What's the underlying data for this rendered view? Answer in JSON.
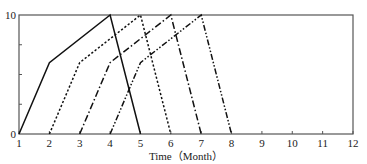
{
  "chart_data": {
    "type": "line",
    "title": "",
    "xlabel": "Time（Month）",
    "ylabel": "",
    "xlim": [
      1,
      12
    ],
    "ylim": [
      0,
      10
    ],
    "x_ticks": [
      1,
      2,
      3,
      4,
      5,
      6,
      7,
      8,
      9,
      10,
      11,
      12
    ],
    "y_tick_labels": [
      {
        "value": 0,
        "label": "0"
      },
      {
        "value": 10,
        "label": "10"
      }
    ],
    "y_minor_ticks": [
      2.5,
      5,
      7.5
    ],
    "grid": false,
    "legend": null,
    "series": [
      {
        "name": "series-1",
        "style": "solid",
        "points": [
          [
            1,
            0
          ],
          [
            2,
            6
          ],
          [
            4,
            10
          ],
          [
            5,
            0
          ]
        ]
      },
      {
        "name": "series-2",
        "style": "dotted",
        "points": [
          [
            2,
            0
          ],
          [
            3,
            6
          ],
          [
            5,
            10
          ],
          [
            6,
            0
          ]
        ]
      },
      {
        "name": "series-3",
        "style": "dash-dot",
        "points": [
          [
            3,
            0
          ],
          [
            4,
            6
          ],
          [
            6,
            10
          ],
          [
            7,
            0
          ]
        ]
      },
      {
        "name": "series-4",
        "style": "dash-dot-dot",
        "points": [
          [
            4,
            0
          ],
          [
            5,
            6
          ],
          [
            7,
            10
          ],
          [
            8,
            0
          ]
        ]
      }
    ]
  },
  "colors": {
    "line": "#111111",
    "frame": "#555555"
  }
}
